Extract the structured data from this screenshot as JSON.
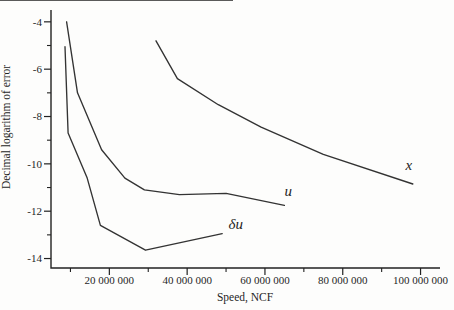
{
  "figure": {
    "background": "#fdfdfc"
  },
  "chart_data": {
    "type": "line",
    "title": "",
    "xlabel": "Speed, NCF",
    "ylabel": "Decimal logarithm of error",
    "xlim": [
      5000000,
      105000000
    ],
    "ylim": [
      -14.4,
      -3.5
    ],
    "grid": false,
    "legend": "inline-curve-labels",
    "line_color": "#333333",
    "axis_color": "#222222",
    "text_color": "#1f1f1f",
    "x_ticks": {
      "major": [
        {
          "value": 20000000,
          "label": "20 000 000"
        },
        {
          "value": 40000000,
          "label": "40 000 000"
        },
        {
          "value": 60000000,
          "label": "60 000 000"
        },
        {
          "value": 80000000,
          "label": "80 000 000"
        },
        {
          "value": 100000000,
          "label": "100 000 000"
        }
      ],
      "minor": [
        10000000,
        30000000,
        50000000,
        70000000,
        90000000
      ]
    },
    "y_ticks": {
      "major": [
        {
          "value": -4,
          "label": "-4"
        },
        {
          "value": -6,
          "label": "-6"
        },
        {
          "value": -8,
          "label": "-8"
        },
        {
          "value": -10,
          "label": "-10"
        },
        {
          "value": -12,
          "label": "-12"
        },
        {
          "value": -14,
          "label": "-14"
        }
      ],
      "minor": [
        -5,
        -7,
        -9,
        -11,
        -13
      ]
    },
    "series": [
      {
        "id": "x",
        "name": "x",
        "x": [
          32000000,
          37500000,
          48000000,
          59000000,
          75000000,
          98000000
        ],
        "y": [
          -4.8,
          -6.4,
          -7.5,
          -8.45,
          -9.6,
          -10.85
        ],
        "label_at": {
          "x": 97000000,
          "y": -10.1
        }
      },
      {
        "id": "u",
        "name": "u",
        "x": [
          9000000,
          11800000,
          18000000,
          24000000,
          29000000,
          38000000,
          50000000,
          65000000
        ],
        "y": [
          -4.0,
          -7.0,
          -9.4,
          -10.6,
          -11.1,
          -11.3,
          -11.25,
          -11.75
        ],
        "label_at": {
          "x": 66000000,
          "y": -11.2
        }
      },
      {
        "id": "delta-u",
        "name": "δu",
        "x": [
          8600000,
          9400000,
          10700000,
          14300000,
          17700000,
          29300000,
          49000000
        ],
        "y": [
          -5.05,
          -8.7,
          -9.2,
          -10.6,
          -12.6,
          -13.65,
          -12.95
        ],
        "label_at": {
          "x": 52500000,
          "y": -12.6
        }
      }
    ]
  }
}
